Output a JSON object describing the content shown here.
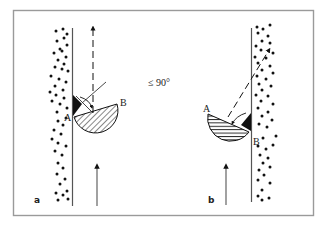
{
  "figure": {
    "frame_color": "#9a9a9a",
    "ink_color": "#111111",
    "angle_label": "≤ 90°",
    "panels": [
      {
        "id": "a",
        "panel_label": "a",
        "point_a_label": "A",
        "point_b_label": "B",
        "hatch": "diagonal",
        "wall_side": "left",
        "arrow_direct": "dashed vertical (upward)",
        "arrow_motion": "solid vertical (upward)"
      },
      {
        "id": "b",
        "panel_label": "b",
        "point_a_label": "A",
        "point_b_label": "B",
        "hatch": "horizontal",
        "wall_side": "right",
        "arrow_direct": "dashed diagonal (up-right)",
        "arrow_motion": "solid vertical (upward)"
      }
    ]
  }
}
